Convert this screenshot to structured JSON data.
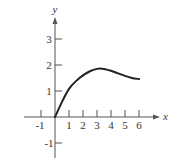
{
  "chart_data": {
    "type": "line",
    "title": "",
    "xlabel": "x",
    "ylabel": "y",
    "xlim": [
      -1.5,
      7
    ],
    "ylim": [
      -1.5,
      3.8
    ],
    "grid": false,
    "legend": null,
    "x_ticks": [
      -1,
      1,
      2,
      3,
      4,
      5,
      6
    ],
    "x_tick_labels": [
      "-1",
      "1",
      "2",
      "3",
      "4",
      "5",
      "6"
    ],
    "y_ticks": [
      -1,
      1,
      2,
      3
    ],
    "y_tick_labels": [
      "-1",
      "1",
      "2",
      "3"
    ],
    "series": [
      {
        "name": "curve",
        "color": "#222222",
        "x": [
          0,
          0.5,
          1,
          1.5,
          2,
          2.5,
          3,
          3.3,
          3.5,
          4,
          4.5,
          5,
          5.5,
          6
        ],
        "y": [
          0,
          0.58,
          1.08,
          1.38,
          1.6,
          1.76,
          1.85,
          1.86,
          1.85,
          1.78,
          1.68,
          1.58,
          1.5,
          1.46
        ]
      }
    ]
  },
  "layout": {
    "origin_px": [
      55,
      117
    ],
    "x_unit_px": 14,
    "y_unit_px": 26
  },
  "colors": {
    "axis": "#555555",
    "curve": "#222222",
    "text": "#333333",
    "background": "#ffffff"
  }
}
